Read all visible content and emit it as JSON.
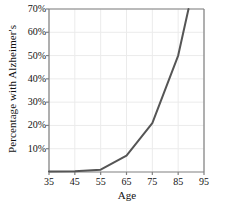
{
  "chart_data": {
    "type": "line",
    "title": "",
    "xlabel": "Age",
    "ylabel": "Percentage with Alzheimer's",
    "xlim": [
      35,
      95
    ],
    "ylim": [
      0,
      70
    ],
    "xticks": [
      "35",
      "45",
      "55",
      "65",
      "75",
      "85",
      "95"
    ],
    "xtick_values": [
      35,
      45,
      55,
      65,
      75,
      85,
      95
    ],
    "yticks": [
      "10%",
      "20%",
      "30%",
      "40%",
      "50%",
      "60%",
      "70%"
    ],
    "ytick_values": [
      10,
      20,
      30,
      40,
      50,
      60,
      70
    ],
    "grid": true,
    "legend": false,
    "series": [
      {
        "name": "Percentage with Alzheimer's",
        "color": "#555555",
        "line_width": 2,
        "x": [
          35,
          45,
          55,
          65,
          75,
          85,
          89
        ],
        "values": [
          0.2,
          0.3,
          1.0,
          7.0,
          21.0,
          50.0,
          70.0
        ]
      }
    ],
    "axis_color": "#808080",
    "grid_color": "#ebebeb",
    "background_color": "#ffffff"
  },
  "plot_geometry": {
    "left": 49,
    "right": 204,
    "top": 9,
    "bottom": 172
  }
}
